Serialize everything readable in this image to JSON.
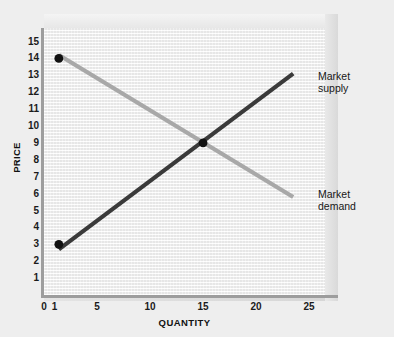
{
  "chart_data": {
    "type": "line",
    "title": "",
    "xlabel": "QUANTITY",
    "ylabel": "PRICE",
    "xlim": [
      0,
      26.5
    ],
    "ylim": [
      0,
      15.8
    ],
    "grid": true,
    "legend_position": "inline-right",
    "xticks": [
      "0",
      "1",
      "5",
      "10",
      "15",
      "20",
      "25"
    ],
    "xtick_values": [
      0,
      1,
      5,
      10,
      15,
      20,
      25
    ],
    "yticks": [
      "1",
      "2",
      "3",
      "4",
      "5",
      "6",
      "7",
      "8",
      "9",
      "10",
      "11",
      "12",
      "13",
      "14",
      "15"
    ],
    "ytick_values": [
      1,
      2,
      3,
      4,
      5,
      6,
      7,
      8,
      9,
      10,
      11,
      12,
      13,
      14,
      15
    ],
    "series": [
      {
        "name": "Market supply",
        "label": "Market\nsupply",
        "color": "#3a3a3a",
        "x": [
          1.4,
          23.5
        ],
        "y": [
          2.7,
          13.1
        ],
        "points": [
          [
            1.4,
            2.7
          ],
          [
            15.0,
            9.0
          ],
          [
            23.5,
            13.1
          ]
        ]
      },
      {
        "name": "Market demand",
        "label": "Market\ndemand",
        "color": "#a8a8a8",
        "x": [
          1.4,
          23.5
        ],
        "y": [
          14.2,
          5.8
        ],
        "points": [
          [
            1.4,
            14.2
          ],
          [
            15.0,
            9.0
          ],
          [
            23.5,
            5.8
          ]
        ]
      }
    ],
    "markers": [
      {
        "name": "demand-endpoint",
        "x": 1.4,
        "y": 14.0,
        "color": "#111111"
      },
      {
        "name": "equilibrium",
        "x": 15.0,
        "y": 9.0,
        "color": "#111111"
      },
      {
        "name": "supply-endpoint",
        "x": 1.4,
        "y": 3.0,
        "color": "#111111"
      }
    ],
    "annotations": [
      {
        "name": "market-supply-label",
        "text": "Market\nsupply"
      },
      {
        "name": "market-demand-label",
        "text": "Market\ndemand"
      }
    ]
  },
  "colors": {
    "background": "#eeeeee",
    "plot_background": "#f0f0f0",
    "supply_line": "#3a3a3a",
    "demand_line": "#a8a8a8",
    "axis": "#9d9d9d",
    "marker": "#111111",
    "text": "#1b1b1b"
  },
  "axes": {
    "x_title": "QUANTITY",
    "y_title": "PRICE"
  },
  "labels": {
    "supply_line1": "Market",
    "supply_line2": "supply",
    "demand_line1": "Market",
    "demand_line2": "demand"
  }
}
